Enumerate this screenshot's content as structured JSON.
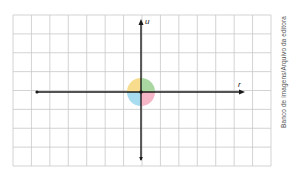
{
  "diagram": {
    "type": "coordinate-grid-with-origin-disc",
    "grid": {
      "left": 13,
      "top": 15,
      "right": 271,
      "bottom": 166,
      "columns": 14,
      "rows": 8,
      "line_color": "#c8c8c8"
    },
    "axes": {
      "origin": {
        "x": 141,
        "y": 92
      },
      "horizontal": {
        "label": "r",
        "from_x": 37,
        "to_x": 245,
        "arrow": "right",
        "start_marker": "dot"
      },
      "vertical": {
        "label": "u",
        "from_y": 19,
        "to_y": 160,
        "arrow": "up",
        "end_marker": "arrow-down-small"
      },
      "color": "#1a1a1a"
    },
    "disc": {
      "radius": 14,
      "quadrants": [
        {
          "position": "top-left",
          "color": "#f6dc8c"
        },
        {
          "position": "top-right",
          "color": "#a9d6a1"
        },
        {
          "position": "bottom-left",
          "color": "#a8dcf0"
        },
        {
          "position": "bottom-right",
          "color": "#f5b6c8"
        }
      ]
    },
    "credit": "Banco de imagens/Arquivo da editora"
  }
}
